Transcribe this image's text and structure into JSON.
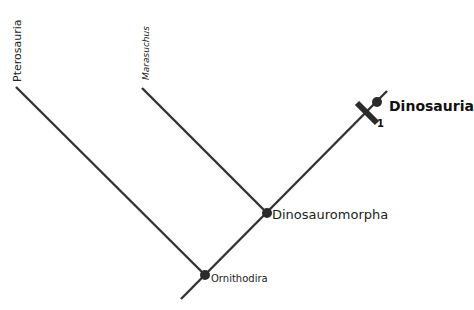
{
  "diagram": {
    "type": "cladogram",
    "colors": {
      "line": "#333333",
      "node": "#2b2b2b",
      "text": "#222222"
    },
    "taxa": [
      {
        "name": "Pterosauria",
        "style": "normal",
        "orientation": "vertical"
      },
      {
        "name": "Marasuchus",
        "style": "italic",
        "orientation": "vertical"
      },
      {
        "name": "Dinosauria",
        "style": "bold",
        "orientation": "horizontal"
      }
    ],
    "nodes": [
      {
        "name": "Ornithodira"
      },
      {
        "name": "Dinosauromorpha"
      },
      {
        "name": "Dinosauria"
      }
    ],
    "synapomorphy": {
      "label": "1"
    }
  }
}
